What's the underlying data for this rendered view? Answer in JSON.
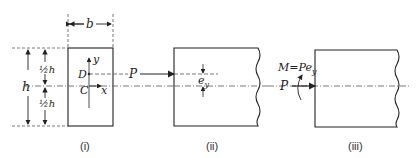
{
  "figure": {
    "panels": [
      {
        "id": "i",
        "caption": "(i)"
      },
      {
        "id": "ii",
        "caption": "(ii)"
      },
      {
        "id": "iii",
        "caption": "(iii)"
      }
    ],
    "panel_i": {
      "width_label": "b",
      "height_label": "h",
      "half_top_label": "½h",
      "half_bottom_label": "½h",
      "point_d": "D",
      "point_c": "C",
      "axis_x": "x",
      "axis_y": "y",
      "load_label": "P"
    },
    "panel_ii": {
      "eccentricity_label": "e",
      "eccentricity_sub": "y"
    },
    "panel_iii": {
      "moment_label": "M=Pe",
      "moment_sub": "y",
      "load_label": "P"
    },
    "colors": {
      "line": "#222222",
      "dash": "#555555"
    }
  }
}
